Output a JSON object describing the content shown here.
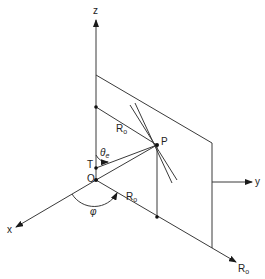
{
  "diagram": {
    "labels": {
      "z": "z",
      "x": "x",
      "y": "y",
      "origin": "O",
      "point_p": "P",
      "point_t": "T",
      "r0_upper": "R",
      "r0_upper_sub": "o",
      "r0_lower": "R",
      "r0_lower_sub": "o",
      "r0_axis": "R",
      "r0_axis_sub": "o",
      "theta": "θ",
      "theta_sub": "e",
      "phi": "φ"
    }
  }
}
